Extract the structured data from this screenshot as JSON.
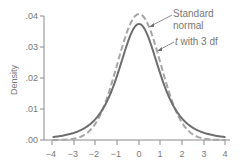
{
  "chart_data": {
    "type": "line",
    "title": "",
    "xlabel": "",
    "ylabel": "Density",
    "xlim": [
      -4,
      4
    ],
    "ylim": [
      0,
      0.04
    ],
    "x_ticks": [
      "-4",
      "-3",
      "-2",
      "-1",
      "0",
      "1",
      "2",
      "3",
      "4"
    ],
    "y_ticks": [
      ".00",
      ".01",
      ".02",
      ".03",
      ".04"
    ],
    "grid": false,
    "legend": "annotations",
    "series": [
      {
        "name": "Standard normal",
        "style": "dashed",
        "x": [
          -4,
          -3.5,
          -3,
          -2.5,
          -2,
          -1.5,
          -1,
          -0.5,
          0,
          0.5,
          1,
          1.5,
          2,
          2.5,
          3,
          3.5,
          4
        ],
        "values": [
          0.0001,
          0.0009,
          0.0044,
          0.0175,
          0.054,
          0.1295,
          0.242,
          0.352,
          0.399,
          0.352,
          0.242,
          0.1295,
          0.054,
          0.0175,
          0.0044,
          0.0009,
          0.0001
        ]
      },
      {
        "name": "t with 3 df",
        "style": "solid",
        "x": [
          -4,
          -3.5,
          -3,
          -2.5,
          -2,
          -1.5,
          -1,
          -0.5,
          0,
          0.5,
          1,
          1.5,
          2,
          2.5,
          3,
          3.5,
          4
        ],
        "values": [
          0.0042,
          0.0073,
          0.0092,
          0.023,
          0.0675,
          0.1249,
          0.2067,
          0.3054,
          0.3676,
          0.3054,
          0.2067,
          0.1249,
          0.0675,
          0.023,
          0.0092,
          0.0073,
          0.0042
        ]
      }
    ],
    "annotations": [
      {
        "label_line1": "Standard",
        "label_line2": "normal",
        "points_to": "Standard normal"
      },
      {
        "label_prefix": "t",
        "label_rest": " with 3 df",
        "points_to": "t with 3 df"
      }
    ],
    "note": "Y tick labels as printed (.00–.04); curve peaks at ~.04 (normal) and ~.037 (t)."
  },
  "labels": {
    "ylabel": "Density",
    "yticks": [
      ".00",
      ".01",
      ".02",
      ".03",
      ".04"
    ],
    "xticks": [
      "−4",
      "−3",
      "−2",
      "−1",
      "0",
      "1",
      "2",
      "3",
      "4"
    ],
    "normal_line1": "Standard",
    "normal_line2": "normal",
    "t_italic": "t",
    "t_rest": " with 3 df"
  },
  "colors": {
    "axis": "#8a8a8a",
    "normal_curve": "#a6a6a6",
    "t_curve": "#6e6e6e",
    "text": "#777777"
  }
}
